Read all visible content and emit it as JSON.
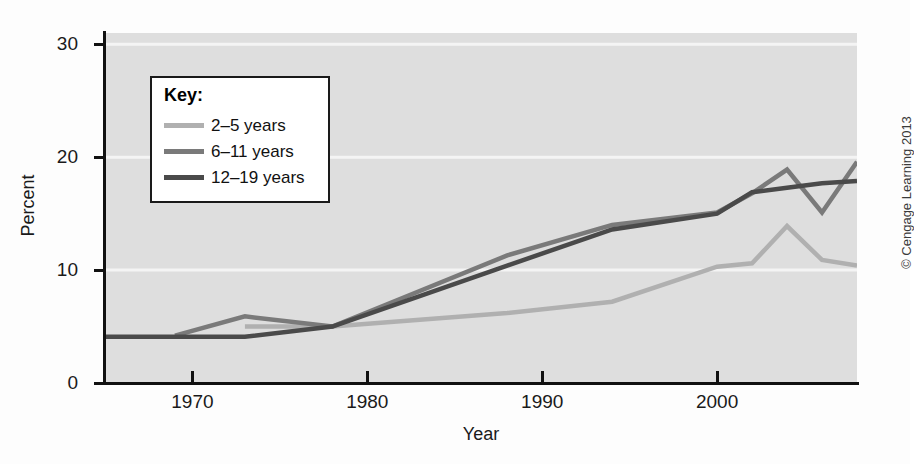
{
  "chart_data": {
    "type": "line",
    "title": "",
    "xlabel": "Year",
    "ylabel": "Percent",
    "xlim": [
      1965,
      2008
    ],
    "ylim": [
      0,
      31
    ],
    "xticks": [
      1970,
      1980,
      1990,
      2000
    ],
    "yticks": [
      0,
      10,
      20,
      30
    ],
    "grid": "horizontal-white",
    "legend_position": "upper-left",
    "legend_title": "Key:",
    "series": [
      {
        "name": "2–5 years",
        "color": "#b0b0b0",
        "x": [
          1973,
          1978,
          1988,
          1994,
          2000,
          2002,
          2004,
          2006,
          2008
        ],
        "values": [
          5.0,
          5.0,
          6.2,
          7.2,
          10.3,
          10.6,
          13.9,
          10.9,
          10.4
        ]
      },
      {
        "name": "6–11 years",
        "color": "#7a7a7a",
        "x": [
          1969,
          1973,
          1978,
          1988,
          1994,
          2000,
          2002,
          2004,
          2006,
          2008
        ],
        "values": [
          4.2,
          5.9,
          5.0,
          11.3,
          14.0,
          15.1,
          16.8,
          18.9,
          15.1,
          19.6
        ]
      },
      {
        "name": "12–19 years",
        "color": "#4a4a4a",
        "x": [
          1965,
          1969,
          1973,
          1978,
          1988,
          1994,
          2000,
          2002,
          2004,
          2006,
          2008
        ],
        "values": [
          4.1,
          4.1,
          4.1,
          5.0,
          10.4,
          13.6,
          15.0,
          16.9,
          17.3,
          17.7,
          17.9
        ]
      }
    ]
  },
  "axes": {
    "y_tick_labels": [
      "30",
      "20",
      "10",
      "0"
    ],
    "x_tick_labels": [
      "1970",
      "1980",
      "1990",
      "2000"
    ],
    "y_title": "Percent",
    "x_title": "Year"
  },
  "legend": {
    "title": "Key:",
    "items": [
      {
        "label": "2–5 years",
        "color": "#b0b0b0"
      },
      {
        "label": "6–11 years",
        "color": "#7a7a7a"
      },
      {
        "label": "12–19 years",
        "color": "#4a4a4a"
      }
    ]
  },
  "credit": {
    "text": "© Cengage Learning 2013"
  },
  "colors": {
    "plot_background": "#dedede",
    "page_background": "#fdfdfd",
    "gridline": "#f4f4f4",
    "axis": "#111111"
  }
}
